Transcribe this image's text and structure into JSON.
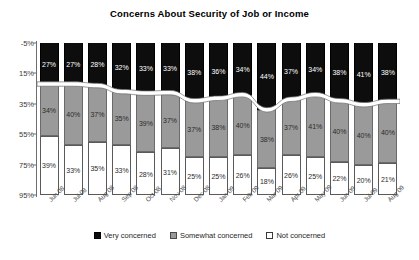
{
  "chart_data": {
    "type": "bar",
    "subtype": "stacked-column-100pct",
    "title": "Concerns About Security of Job or Income",
    "xlabel": "",
    "ylabel": "",
    "ylim": [
      -5,
      95
    ],
    "y_axis_inverted": true,
    "grid": false,
    "legend_position": "bottom",
    "ytick_labels": [
      "-5%",
      "15%",
      "35%",
      "55%",
      "75%",
      "95%"
    ],
    "ytick_values": [
      -5,
      15,
      35,
      55,
      75,
      95
    ],
    "categories": [
      "Jun 08",
      "Jul 08",
      "Aug 08",
      "Sep 08",
      "Oct 08",
      "Nov 08",
      "Dec 08",
      "Jan 09",
      "Feb 09",
      "Mar 09",
      "Apr 09",
      "May 09",
      "Jun 09",
      "Jul 09",
      "Aug 09"
    ],
    "series": [
      {
        "name": "Very concerned",
        "color": "#0d0d0d",
        "values": [
          27,
          27,
          28,
          32,
          33,
          33,
          38,
          36,
          34,
          44,
          37,
          34,
          38,
          41,
          38
        ],
        "labels": [
          "27%",
          "27%",
          "28%",
          "32%",
          "33%",
          "33%",
          "38%",
          "36%",
          "34%",
          "44%",
          "37%",
          "34%",
          "38%",
          "41%",
          "38%"
        ]
      },
      {
        "name": "Somewhat concerned",
        "color": "#9a9a9a",
        "values": [
          34,
          40,
          37,
          35,
          39,
          37,
          37,
          38,
          40,
          38,
          37,
          41,
          40,
          40,
          40
        ],
        "labels": [
          "34%",
          "40%",
          "37%",
          "35%",
          "39%",
          "37%",
          "37%",
          "38%",
          "40%",
          "38%",
          "37%",
          "41%",
          "40%",
          "40%",
          "40%"
        ]
      },
      {
        "name": "Not concerned",
        "color": "#ffffff",
        "values": [
          39,
          33,
          35,
          33,
          28,
          31,
          25,
          25,
          26,
          18,
          26,
          25,
          22,
          20,
          21
        ],
        "labels": [
          "39%",
          "33%",
          "35%",
          "33%",
          "28%",
          "31%",
          "25%",
          "25%",
          "26%",
          "18%",
          "26%",
          "25%",
          "22%",
          "20%",
          "21%"
        ]
      }
    ]
  },
  "legend": {
    "items": [
      {
        "label": "Very concerned"
      },
      {
        "label": "Somewhat concerned"
      },
      {
        "label": "Not concerned"
      }
    ]
  }
}
